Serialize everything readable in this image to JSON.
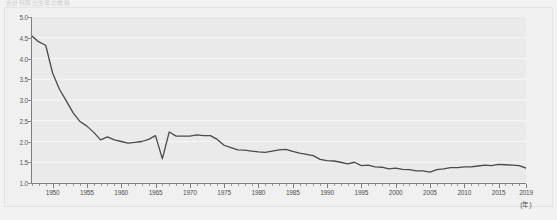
{
  "title": {
    "text": "合計特殊出生率の推移"
  },
  "axis": {
    "y_ticks": [
      "1.0",
      "1.5",
      "2.0",
      "2.5",
      "3.0",
      "3.5",
      "4.0",
      "4.5",
      "5.0"
    ],
    "x_ticks": [
      "1950",
      "1955",
      "1960",
      "1965",
      "1970",
      "1975",
      "1980",
      "1985",
      "1990",
      "1995",
      "2000",
      "2005",
      "2010",
      "2015",
      "2019"
    ],
    "x_unit": "(年)"
  },
  "colors": {
    "line": "#4a4a4a",
    "plot_bg": "#eaeaea",
    "grid": "#f7f7f7",
    "axis": "#7d7d7d",
    "page_bg": "#f2f2f2"
  },
  "chart_data": {
    "type": "line",
    "title": "合計特殊出生率の推移",
    "xlabel": "(年)",
    "ylabel": "",
    "xlim": [
      1947,
      2019
    ],
    "ylim": [
      1.0,
      5.0
    ],
    "grid": true,
    "legend": "none",
    "x": [
      1947,
      1948,
      1949,
      1950,
      1951,
      1952,
      1953,
      1954,
      1955,
      1956,
      1957,
      1958,
      1959,
      1960,
      1961,
      1962,
      1963,
      1964,
      1965,
      1966,
      1967,
      1968,
      1969,
      1970,
      1971,
      1972,
      1973,
      1974,
      1975,
      1976,
      1977,
      1978,
      1979,
      1980,
      1981,
      1982,
      1983,
      1984,
      1985,
      1986,
      1987,
      1988,
      1989,
      1990,
      1991,
      1992,
      1993,
      1994,
      1995,
      1996,
      1997,
      1998,
      1999,
      2000,
      2001,
      2002,
      2003,
      2004,
      2005,
      2006,
      2007,
      2008,
      2009,
      2010,
      2011,
      2012,
      2013,
      2014,
      2015,
      2016,
      2017,
      2018,
      2019
    ],
    "series": [
      {
        "name": "合計特殊出生率",
        "values": [
          4.54,
          4.4,
          4.32,
          3.65,
          3.26,
          2.98,
          2.69,
          2.48,
          2.37,
          2.22,
          2.04,
          2.11,
          2.04,
          2.0,
          1.96,
          1.98,
          2.0,
          2.05,
          2.14,
          1.58,
          2.23,
          2.13,
          2.13,
          2.13,
          2.16,
          2.14,
          2.14,
          2.05,
          1.91,
          1.85,
          1.8,
          1.79,
          1.77,
          1.75,
          1.74,
          1.77,
          1.8,
          1.81,
          1.76,
          1.72,
          1.69,
          1.66,
          1.57,
          1.54,
          1.53,
          1.5,
          1.46,
          1.5,
          1.42,
          1.43,
          1.39,
          1.38,
          1.34,
          1.36,
          1.33,
          1.32,
          1.29,
          1.29,
          1.26,
          1.32,
          1.34,
          1.37,
          1.37,
          1.39,
          1.39,
          1.41,
          1.43,
          1.42,
          1.45,
          1.44,
          1.43,
          1.42,
          1.36
        ]
      }
    ]
  }
}
